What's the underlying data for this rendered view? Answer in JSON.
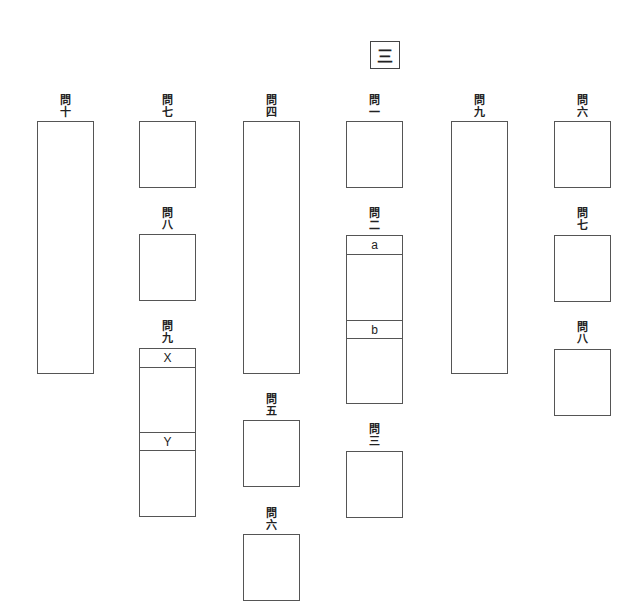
{
  "section": {
    "label": "三"
  },
  "question_prefix": "問",
  "columns": [
    {
      "questions": [
        {
          "id": "q10",
          "number": "十",
          "size": "tall"
        }
      ]
    },
    {
      "questions": [
        {
          "id": "q7a",
          "number": "七",
          "size": "small"
        },
        {
          "id": "q8a",
          "number": "八",
          "size": "small"
        },
        {
          "id": "q9a",
          "number": "九",
          "size": "split",
          "sub_labels": [
            "X",
            "Y"
          ]
        }
      ]
    },
    {
      "questions": [
        {
          "id": "q4",
          "number": "四",
          "size": "tall"
        },
        {
          "id": "q5",
          "number": "五",
          "size": "small"
        },
        {
          "id": "q6a",
          "number": "六",
          "size": "small"
        }
      ]
    },
    {
      "questions": [
        {
          "id": "q1",
          "number": "一",
          "size": "small"
        },
        {
          "id": "q2",
          "number": "二",
          "size": "split",
          "sub_labels": [
            "a",
            "b"
          ]
        },
        {
          "id": "q3",
          "number": "三",
          "size": "small"
        }
      ]
    },
    {
      "questions": [
        {
          "id": "q9b",
          "number": "九",
          "size": "tall"
        }
      ]
    },
    {
      "questions": [
        {
          "id": "q6b",
          "number": "六",
          "size": "small"
        },
        {
          "id": "q7b",
          "number": "七",
          "size": "small"
        },
        {
          "id": "q8b",
          "number": "八",
          "size": "small"
        }
      ]
    }
  ]
}
